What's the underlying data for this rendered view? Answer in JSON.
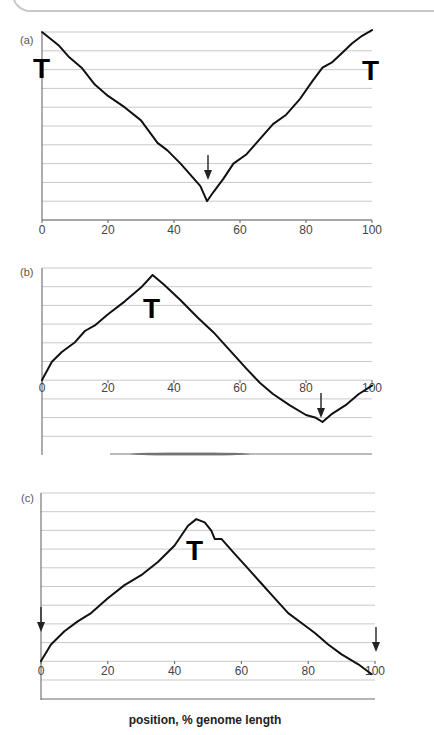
{
  "chart_data": [
    {
      "type": "line",
      "panel": "(a)",
      "x": [
        0,
        5,
        8,
        12,
        16,
        20,
        25,
        30,
        35,
        38,
        42,
        46,
        48,
        50,
        52,
        55,
        58,
        62,
        66,
        70,
        74,
        78,
        82,
        85,
        88,
        91,
        94,
        97,
        100
      ],
      "values": [
        10.0,
        9.3,
        8.7,
        8.1,
        7.2,
        6.6,
        6.0,
        5.3,
        4.1,
        3.7,
        3.0,
        2.2,
        1.8,
        1.0,
        1.5,
        2.2,
        3.0,
        3.5,
        4.3,
        5.1,
        5.6,
        6.4,
        7.4,
        8.1,
        8.4,
        8.9,
        9.4,
        9.8,
        10.1
      ],
      "xlabel": "position, % genome length",
      "ylabel": "",
      "xticks": [
        "0",
        "20",
        "40",
        "60",
        "80",
        "100"
      ],
      "xlim": [
        0,
        100
      ],
      "ylim": [
        0,
        11
      ],
      "grid": true,
      "annotations": [
        {
          "label": "T",
          "x": 0,
          "note": "terminus at left end"
        },
        {
          "label": "T",
          "x": 100,
          "note": "terminus at right end"
        },
        {
          "label": "arrow-down",
          "x": 50,
          "note": "origin at minimum"
        }
      ]
    },
    {
      "type": "line",
      "panel": "(b)",
      "x": [
        0,
        3,
        6,
        10,
        13,
        16,
        20,
        25,
        30,
        33.5,
        37,
        42,
        47,
        52,
        57,
        62,
        66,
        70,
        75,
        80,
        83,
        85,
        88,
        92,
        96,
        100
      ],
      "values": [
        0,
        1.3,
        2.0,
        2.7,
        3.5,
        3.9,
        4.7,
        5.6,
        6.6,
        7.5,
        6.8,
        5.7,
        4.5,
        3.4,
        2.1,
        0.8,
        -0.2,
        -1.0,
        -1.8,
        -2.5,
        -2.7,
        -3.0,
        -2.4,
        -1.8,
        -1.0,
        -0.4
      ],
      "xlabel": "position, % genome length",
      "ylabel": "",
      "xticks": [
        "0",
        "20",
        "40",
        "60",
        "80",
        "100"
      ],
      "xlim": [
        0,
        100
      ],
      "ylim": [
        -4,
        7
      ],
      "grid": true,
      "annotations": [
        {
          "label": "T",
          "x": 33.5,
          "note": "terminus at peak"
        },
        {
          "label": "arrow-down",
          "x": 85,
          "note": "origin at minimum"
        }
      ]
    },
    {
      "type": "line",
      "panel": "(c)",
      "x": [
        0,
        3,
        7,
        11,
        15,
        20,
        25,
        30,
        35,
        40,
        44,
        46.5,
        49,
        51,
        52,
        54,
        58,
        62,
        66,
        70,
        74,
        78,
        82,
        86,
        90,
        95,
        99
      ],
      "values": [
        0,
        1.0,
        1.8,
        2.4,
        2.9,
        3.8,
        4.6,
        5.2,
        6.0,
        7.0,
        8.2,
        8.6,
        8.4,
        7.9,
        7.4,
        7.4,
        6.5,
        5.6,
        4.7,
        3.8,
        2.9,
        2.3,
        1.7,
        1.0,
        0.4,
        -0.2,
        -0.8
      ],
      "xlabel": "position, % genome length",
      "ylabel": "",
      "xticks": [
        "0",
        "20",
        "40",
        "60",
        "80",
        "100"
      ],
      "xlim": [
        0,
        100
      ],
      "ylim": [
        -2,
        9
      ],
      "grid": true,
      "annotations": [
        {
          "label": "T",
          "x": 46.5,
          "note": "terminus at peak"
        },
        {
          "label": "arrow-down",
          "x": 0,
          "note": "origin at left end"
        },
        {
          "label": "arrow-down",
          "x": 100,
          "note": "origin at right end"
        }
      ]
    }
  ],
  "panels": {
    "a": {
      "label": "(a)",
      "t_left": "T",
      "t_right": "T"
    },
    "b": {
      "label": "(b)",
      "t": "T"
    },
    "c": {
      "label": "(c)",
      "t": "T"
    }
  },
  "xticks": [
    "0",
    "20",
    "40",
    "60",
    "80",
    "100"
  ],
  "xaxis_title": "position, % genome length",
  "colors": {
    "curve": "#111111",
    "grid": "#c9c9c9",
    "axis": "#6a6a6a"
  }
}
